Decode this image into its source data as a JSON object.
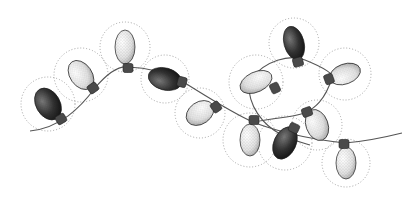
{
  "illustration": {
    "subject": "string of Christmas lights",
    "style": "stippled pen illustration",
    "colors": {
      "background": "#ffffff",
      "wire": "#555555",
      "halo": "#9a9a9a",
      "socket": "#4a4a4a",
      "dark_bulb": "#2a2a2a",
      "light_bulb": "#d8d8d8"
    },
    "wire_paths": [
      "M30,131 C60,128 80,108 95,88 C110,70 120,66 128,67 C150,68 165,72 180,80 C200,92 230,112 255,123 C275,130 300,138 345,143 C370,141 390,136 402,133",
      "M250,80 C265,60 290,54 305,60 C325,68 335,75 332,78 C325,100 315,108 305,113 C290,118 270,118 255,122"
    ],
    "loop_path": "M249,84 C248,105 262,125 282,135 C292,140 300,142 310,145",
    "bulbs": [
      {
        "id": 1,
        "cx": 48,
        "cy": 104,
        "rx": 12,
        "ry": 17,
        "rot": -30,
        "tone": "dark",
        "sx": 61,
        "sy": 119,
        "halo_r": 27
      },
      {
        "id": 2,
        "cx": 81,
        "cy": 75,
        "rx": 11,
        "ry": 16,
        "rot": -35,
        "tone": "light",
        "sx": 93,
        "sy": 88,
        "halo_r": 27
      },
      {
        "id": 3,
        "cx": 125,
        "cy": 47,
        "rx": 10,
        "ry": 17,
        "rot": 0,
        "tone": "light",
        "sx": 128,
        "sy": 68,
        "halo_r": 25
      },
      {
        "id": 4,
        "cx": 165,
        "cy": 79,
        "rx": 11,
        "ry": 17,
        "rot": -75,
        "tone": "dark",
        "sx": 182,
        "sy": 82,
        "halo_r": 24
      },
      {
        "id": 5,
        "cx": 200,
        "cy": 113,
        "rx": 11,
        "ry": 15,
        "rot": 55,
        "tone": "light",
        "sx": 216,
        "sy": 107,
        "halo_r": 25
      },
      {
        "id": 6,
        "cx": 256,
        "cy": 82,
        "rx": 10,
        "ry": 17,
        "rot": 65,
        "tone": "light",
        "sx": 275,
        "sy": 88,
        "halo_r": 27
      },
      {
        "id": 7,
        "cx": 294,
        "cy": 43,
        "rx": 10,
        "ry": 17,
        "rot": -15,
        "tone": "dark",
        "sx": 298,
        "sy": 62,
        "halo_r": 25
      },
      {
        "id": 8,
        "cx": 345,
        "cy": 74,
        "rx": 10,
        "ry": 16,
        "rot": -110,
        "tone": "light",
        "sx": 329,
        "sy": 79,
        "halo_r": 26
      },
      {
        "id": 9,
        "cx": 250,
        "cy": 140,
        "rx": 10,
        "ry": 16,
        "rot": 0,
        "tone": "light",
        "sx": 254,
        "sy": 120,
        "halo_r": 27
      },
      {
        "id": 10,
        "cx": 285,
        "cy": 143,
        "rx": 11,
        "ry": 17,
        "rot": 25,
        "tone": "dark",
        "sx": 294,
        "sy": 128,
        "halo_r": 27
      },
      {
        "id": 11,
        "cx": 317,
        "cy": 125,
        "rx": 11,
        "ry": 16,
        "rot": -20,
        "tone": "light",
        "sx": 307,
        "sy": 112,
        "halo_r": 25
      },
      {
        "id": 12,
        "cx": 346,
        "cy": 163,
        "rx": 10,
        "ry": 16,
        "rot": 0,
        "tone": "light",
        "sx": 344,
        "sy": 144,
        "halo_r": 24
      }
    ]
  }
}
